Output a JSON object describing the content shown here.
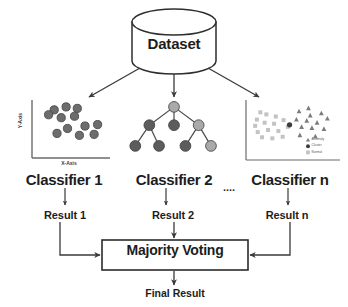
{
  "diagram": {
    "title_node": {
      "label": "Dataset",
      "shape": "cylinder-icon"
    },
    "classifiers": [
      {
        "label": "Classifier 1",
        "viz": "scatter-plot",
        "result": "Result 1"
      },
      {
        "label": "Classifier 2",
        "viz": "decision-tree",
        "result": "Result 2"
      },
      {
        "label": "Classifier n",
        "viz": "scatter-plot-legend",
        "result": "Result n"
      }
    ],
    "ellipsis": "....",
    "aggregator": {
      "label": "Majority Voting"
    },
    "output": {
      "label": "Final Result"
    },
    "plot1": {
      "x_axis_label": "X-Axis",
      "y_axis_label": "Y-Axis",
      "points": [
        [
          26,
          14
        ],
        [
          43,
          8
        ],
        [
          59,
          11
        ],
        [
          18,
          24
        ],
        [
          36,
          30
        ],
        [
          55,
          27
        ],
        [
          70,
          47
        ],
        [
          88,
          44
        ],
        [
          45,
          52
        ],
        [
          30,
          62
        ],
        [
          62,
          66
        ],
        [
          83,
          64
        ]
      ],
      "marker_fill": "#6d6d6d",
      "marker_stroke": "#4a4a4a"
    },
    "tree": {
      "nodes": [
        {
          "id": "root",
          "x": 50,
          "y": 8,
          "tone": "light"
        },
        {
          "id": "c1",
          "x": 22,
          "y": 38,
          "tone": "dark"
        },
        {
          "id": "c2",
          "x": 50,
          "y": 38,
          "tone": "dark"
        },
        {
          "id": "c3",
          "x": 78,
          "y": 38,
          "tone": "light"
        },
        {
          "id": "l1",
          "x": 6,
          "y": 72,
          "tone": "dark"
        },
        {
          "id": "l2",
          "x": 33,
          "y": 72,
          "tone": "dark"
        },
        {
          "id": "l3",
          "x": 63,
          "y": 72,
          "tone": "dark"
        },
        {
          "id": "l4",
          "x": 92,
          "y": 72,
          "tone": "light"
        }
      ],
      "edges": [
        [
          "root",
          "c1"
        ],
        [
          "root",
          "c2"
        ],
        [
          "root",
          "c3"
        ],
        [
          "c1",
          "l1"
        ],
        [
          "c1",
          "l2"
        ],
        [
          "c3",
          "l3"
        ],
        [
          "c3",
          "l4"
        ]
      ],
      "tone_light": "#a9a9a9",
      "tone_dark": "#5c5c5c",
      "stroke": "#3f3f3f"
    },
    "plot3": {
      "legend": [
        {
          "marker": "triangle-icon",
          "label": "Anomaly"
        },
        {
          "marker": "circle-icon",
          "label": "Cluster"
        },
        {
          "marker": "square-icon",
          "label": "Normal"
        }
      ],
      "squares": [
        [
          8,
          30
        ],
        [
          19,
          20
        ],
        [
          30,
          24
        ],
        [
          6,
          42
        ],
        [
          17,
          36
        ],
        [
          28,
          38
        ],
        [
          39,
          31
        ],
        [
          9,
          54
        ],
        [
          21,
          50
        ],
        [
          33,
          52
        ],
        [
          14,
          64
        ],
        [
          26,
          66
        ],
        [
          38,
          63
        ],
        [
          44,
          44
        ],
        [
          12,
          16
        ]
      ],
      "triangles": [
        [
          57,
          14
        ],
        [
          70,
          22
        ],
        [
          83,
          18
        ],
        [
          54,
          30
        ],
        [
          66,
          32
        ],
        [
          78,
          36
        ],
        [
          90,
          28
        ],
        [
          60,
          44
        ],
        [
          72,
          46
        ],
        [
          86,
          48
        ],
        [
          58,
          60
        ],
        [
          76,
          62
        ],
        [
          68,
          8
        ]
      ],
      "highlight": [
        46,
        40
      ],
      "square_fill": "#c3c3c3",
      "triangle_fill": "#7c7c7c",
      "highlight_fill": "#3c3c3c"
    },
    "colors": {
      "line": "#3a3a3a",
      "text": "#1d1d1d",
      "axis": "#6b6b6b",
      "box_border": "#2b2b2b",
      "background": "#ffffff"
    }
  }
}
